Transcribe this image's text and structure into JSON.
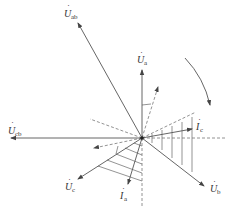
{
  "diagram": {
    "type": "phasor-diagram",
    "colors": {
      "line": "#555555",
      "dashed": "#777777",
      "text": "#333333",
      "background": "#ffffff"
    },
    "origin": {
      "x": 142,
      "y": 138
    },
    "phasors": [
      {
        "id": "U_ab",
        "symbol": "U",
        "subscript": "ab",
        "dot": "·",
        "kind": "voltage",
        "tip": {
          "x": 77,
          "y": 21
        },
        "label_pos": {
          "x": 64,
          "y": 14
        }
      },
      {
        "id": "U_a",
        "symbol": "U",
        "subscript": "a",
        "dot": "·",
        "kind": "voltage",
        "tip": {
          "x": 142,
          "y": 68
        },
        "label_pos": {
          "x": 137,
          "y": 60
        }
      },
      {
        "id": "U_cb",
        "symbol": "U",
        "subscript": "cb",
        "dot": "·",
        "kind": "voltage",
        "tip": {
          "x": 9,
          "y": 138
        },
        "label_pos": {
          "x": 8,
          "y": 131
        }
      },
      {
        "id": "U_c",
        "symbol": "U",
        "subscript": "c",
        "dot": "·",
        "kind": "voltage",
        "tip": {
          "x": 77,
          "y": 180
        },
        "label_pos": {
          "x": 65,
          "y": 188
        }
      },
      {
        "id": "U_b",
        "symbol": "U",
        "subscript": "b",
        "dot": "·",
        "kind": "voltage",
        "tip": {
          "x": 206,
          "y": 187
        },
        "label_pos": {
          "x": 210,
          "y": 190
        }
      },
      {
        "id": "I_a",
        "symbol": "I",
        "subscript": "a",
        "dot": "·",
        "kind": "current",
        "tip": {
          "x": 127,
          "y": 186
        },
        "label_pos": {
          "x": 120,
          "y": 198
        }
      },
      {
        "id": "I_c",
        "symbol": "I",
        "subscript": "c",
        "dot": "·",
        "kind": "current",
        "tip": {
          "x": 194,
          "y": 128
        },
        "label_pos": {
          "x": 196,
          "y": 128
        }
      }
    ],
    "reference_lines": [
      {
        "id": "dashed-upper-right-arrow",
        "to": {
          "x": 159,
          "y": 85
        },
        "arrow": true
      },
      {
        "id": "dashed-right-incline",
        "to": {
          "x": 196,
          "y": 112
        },
        "arrow": false
      },
      {
        "id": "dashed-horizontal-right",
        "to": {
          "x": 225,
          "y": 138
        },
        "arrow": false
      },
      {
        "id": "dashed-lower-left-arrow",
        "to": {
          "x": 92,
          "y": 148
        },
        "arrow": true
      },
      {
        "id": "dashed-upper-left",
        "to": {
          "x": 90,
          "y": 119
        },
        "arrow": false
      },
      {
        "id": "dashed-vertical-down",
        "to": {
          "x": 142,
          "y": 207
        },
        "arrow": false
      }
    ],
    "rotation_arrow": {
      "direction": "clockwise",
      "start": {
        "x": 185,
        "y": 58
      },
      "end": {
        "x": 211,
        "y": 107
      }
    },
    "hatched_regions": [
      "right sector between I_c-side dashed line and U_b",
      "lower-left sector between U_c and dashed vertical"
    ]
  }
}
